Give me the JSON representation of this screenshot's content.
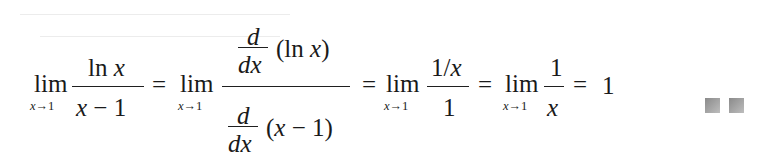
{
  "equation": {
    "description": "L'Hopital's rule evaluation of lim ln x/(x-1) as x approaches 1",
    "term1": {
      "lim": "lim",
      "sub_var": "x",
      "sub_arrow": "→",
      "sub_val": "1",
      "numerator_fn": "ln",
      "numerator_var": "x",
      "denominator_var": "x",
      "denominator_op": "−",
      "denominator_val": "1"
    },
    "eq1": "=",
    "term2": {
      "lim": "lim",
      "sub_var": "x",
      "sub_arrow": "→",
      "sub_val": "1",
      "top_d_num": "d",
      "top_d_den": "dx",
      "top_arg_open": "(",
      "top_arg_fn": "ln",
      "top_arg_var": "x",
      "top_arg_close": ")",
      "bottom_d_num": "d",
      "bottom_d_den": "dx",
      "bottom_arg_open": "(",
      "bottom_arg_var": "x",
      "bottom_arg_op": "−",
      "bottom_arg_val": "1",
      "bottom_arg_close": ")"
    },
    "eq2": "=",
    "term3": {
      "lim": "lim",
      "sub_var": "x",
      "sub_arrow": "→",
      "sub_val": "1",
      "numerator_one": "1/",
      "numerator_var": "x",
      "denominator": "1"
    },
    "eq3": "=",
    "term4": {
      "lim": "lim",
      "sub_var": "x",
      "sub_arrow": "→",
      "sub_val": "1",
      "numerator": "1",
      "denominator_var": "x"
    },
    "eq4": "=",
    "result": "1"
  },
  "end_marks": {
    "count": 2,
    "color": "#9a9a9a"
  }
}
